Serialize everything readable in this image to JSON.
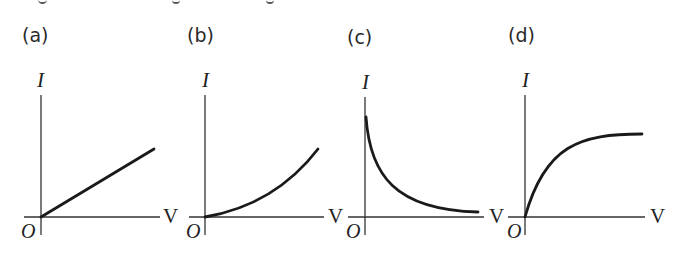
{
  "figure": {
    "panels": [
      {
        "id": "a",
        "label": "(a)",
        "y_axis_label": "I",
        "x_axis_label": "V",
        "origin_label": "O",
        "curve_type": "linear",
        "description": "Straight line through origin, constant slope"
      },
      {
        "id": "b",
        "label": "(b)",
        "y_axis_label": "I",
        "x_axis_label": "V",
        "origin_label": "O",
        "curve_type": "concave-up",
        "description": "Curve through origin with increasing slope"
      },
      {
        "id": "c",
        "label": "(c)",
        "y_axis_label": "I",
        "x_axis_label": "V",
        "origin_label": "O",
        "curve_type": "decaying",
        "description": "Curve starting high on I axis, decreasing and approaching V axis"
      },
      {
        "id": "d",
        "label": "(d)",
        "y_axis_label": "I",
        "x_axis_label": "V",
        "origin_label": "O",
        "curve_type": "saturating",
        "description": "Curve through origin rising steeply then leveling off"
      }
    ],
    "colors": {
      "line": "#1a1a1a",
      "axis": "#333333",
      "background": "#ffffff"
    }
  }
}
